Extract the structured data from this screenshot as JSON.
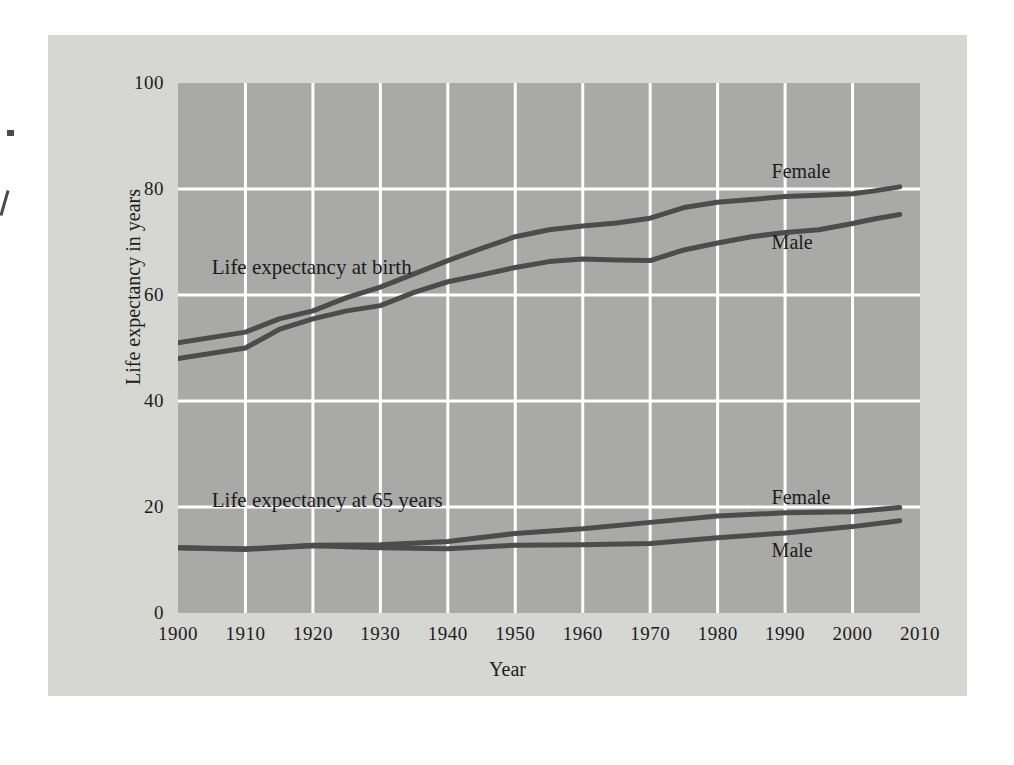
{
  "chart_data": {
    "type": "line",
    "title": "",
    "xlabel": "Year",
    "ylabel": "Life expectancy in years",
    "xlim": [
      1900,
      2010
    ],
    "ylim": [
      0,
      100
    ],
    "xticks": [
      "1900",
      "1910",
      "1920",
      "1930",
      "1940",
      "1950",
      "1960",
      "1970",
      "1980",
      "1990",
      "2000",
      "2010"
    ],
    "yticks": [
      "0",
      "20",
      "40",
      "60",
      "80",
      "100"
    ],
    "grid": true,
    "legend_position": "inline-annotations",
    "plot_bg": "#a9a9a7",
    "figure_bg": "#d6d6d3",
    "grid_color": "#ffffff",
    "line_color": "#4c4c4c",
    "group_annotations": [
      {
        "text": "Life expectancy at birth",
        "x": 1905,
        "y": 67.5
      },
      {
        "text": "Life expectancy at 65 years",
        "x": 1905,
        "y": 23.5
      }
    ],
    "series": [
      {
        "name": "Female",
        "group": "Life expectancy at birth",
        "label_x": 1988,
        "label_y": 85.5,
        "x": [
          1900,
          1910,
          1915,
          1920,
          1925,
          1930,
          1935,
          1940,
          1945,
          1950,
          1955,
          1960,
          1965,
          1970,
          1975,
          1980,
          1985,
          1990,
          1995,
          2000,
          2003,
          2007
        ],
        "y": [
          51.0,
          53.0,
          55.5,
          57.0,
          59.5,
          61.5,
          64.0,
          66.5,
          68.8,
          71.0,
          72.3,
          73.0,
          73.6,
          74.5,
          76.5,
          77.5,
          78.0,
          78.6,
          78.8,
          79.1,
          79.6,
          80.4
        ]
      },
      {
        "name": "Male",
        "group": "Life expectancy at birth",
        "label_x": 1988,
        "label_y": 72.0,
        "x": [
          1900,
          1910,
          1915,
          1920,
          1925,
          1930,
          1935,
          1940,
          1945,
          1950,
          1955,
          1960,
          1965,
          1970,
          1975,
          1980,
          1985,
          1990,
          1995,
          2000,
          2003,
          2007
        ],
        "y": [
          48.0,
          50.0,
          53.5,
          55.5,
          57.0,
          58.0,
          60.5,
          62.5,
          63.8,
          65.2,
          66.3,
          66.8,
          66.6,
          66.5,
          68.5,
          69.8,
          71.0,
          71.8,
          72.3,
          73.5,
          74.3,
          75.2
        ]
      },
      {
        "name": "Female",
        "group": "Life expectancy at 65 years",
        "label_x": 1988,
        "label_y": 24.0,
        "x": [
          1900,
          1910,
          1920,
          1930,
          1940,
          1950,
          1960,
          1970,
          1980,
          1990,
          2000,
          2007
        ],
        "y": [
          12.3,
          12.1,
          12.8,
          12.9,
          13.5,
          15.0,
          15.9,
          17.1,
          18.3,
          18.9,
          19.1,
          19.9
        ]
      },
      {
        "name": "Male",
        "group": "Life expectancy at 65 years",
        "label_x": 1988,
        "label_y": 14.0,
        "x": [
          1900,
          1910,
          1920,
          1930,
          1940,
          1950,
          1960,
          1970,
          1980,
          1990,
          2000,
          2007
        ],
        "y": [
          12.3,
          12.0,
          12.7,
          12.3,
          12.1,
          12.8,
          12.9,
          13.1,
          14.2,
          15.1,
          16.3,
          17.4
        ]
      }
    ]
  }
}
